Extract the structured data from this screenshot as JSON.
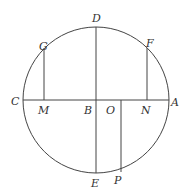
{
  "diagram": {
    "circle": {
      "cx": 96,
      "cy": 100,
      "r": 73
    },
    "labels": {
      "A": "A",
      "B": "B",
      "C": "C",
      "D": "D",
      "E": "E",
      "F": "F",
      "G": "G",
      "M": "M",
      "N": "N",
      "O": "O",
      "P": "P"
    },
    "points": {
      "A": [
        169,
        100
      ],
      "B": [
        96,
        100
      ],
      "C": [
        23,
        100
      ],
      "D": [
        96,
        27
      ],
      "E": [
        96,
        173
      ],
      "F": [
        147,
        48
      ],
      "G": [
        44,
        48
      ],
      "M": [
        44,
        100
      ],
      "N": [
        147,
        100
      ],
      "O": [
        121,
        100
      ],
      "P": [
        121,
        172
      ]
    },
    "segments": [
      "CA",
      "DE",
      "GM",
      "FN",
      "OP"
    ],
    "colors": {
      "stroke": "#444444",
      "text": "#333333"
    }
  }
}
